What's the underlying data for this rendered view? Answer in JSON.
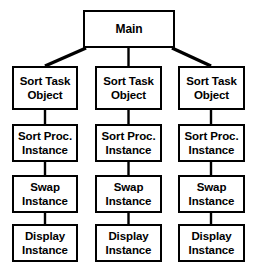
{
  "diagram": {
    "title": "Main",
    "type": "hierarchy-tree",
    "colors": {
      "box_border": "#000000",
      "box_fill": "#ffffff",
      "connector": "#000000",
      "background": "#ffffff",
      "text": "#000000"
    },
    "root": {
      "id": "main",
      "label": "Main",
      "lines": [
        "Main"
      ]
    },
    "columns": [
      {
        "id": "column-1",
        "nodes": [
          {
            "id": "sort-task-object-1",
            "lines": [
              "Sort Task",
              "Object"
            ],
            "label": "Sort Task Object"
          },
          {
            "id": "sort-proc-instance-1",
            "lines": [
              "Sort Proc.",
              "Instance"
            ],
            "label": "Sort Proc. Instance"
          },
          {
            "id": "swap-instance-1",
            "lines": [
              "Swap",
              "Instance"
            ],
            "label": "Swap Instance"
          },
          {
            "id": "display-instance-1",
            "lines": [
              "Display",
              "Instance"
            ],
            "label": "Display Instance"
          }
        ]
      },
      {
        "id": "column-2",
        "nodes": [
          {
            "id": "sort-task-object-2",
            "lines": [
              "Sort Task",
              "Object"
            ],
            "label": "Sort Task Object"
          },
          {
            "id": "sort-proc-instance-2",
            "lines": [
              "Sort Proc.",
              "Instance"
            ],
            "label": "Sort Proc. Instance"
          },
          {
            "id": "swap-instance-2",
            "lines": [
              "Swap",
              "Instance"
            ],
            "label": "Swap Instance"
          },
          {
            "id": "display-instance-2",
            "lines": [
              "Display",
              "Instance"
            ],
            "label": "Display Instance"
          }
        ]
      },
      {
        "id": "column-3",
        "nodes": [
          {
            "id": "sort-task-object-3",
            "lines": [
              "Sort Task",
              "Object"
            ],
            "label": "Sort Task Object"
          },
          {
            "id": "sort-proc-instance-3",
            "lines": [
              "Sort Proc.",
              "Instance"
            ],
            "label": "Sort Proc. Instance"
          },
          {
            "id": "swap-instance-3",
            "lines": [
              "Swap",
              "Instance"
            ],
            "label": "Swap Instance"
          },
          {
            "id": "display-instance-3",
            "lines": [
              "Display",
              "Instance"
            ],
            "label": "Display Instance"
          }
        ]
      }
    ]
  }
}
